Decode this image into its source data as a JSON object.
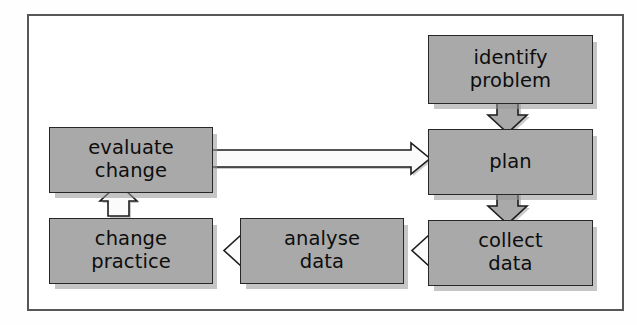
{
  "figure": {
    "kind": "flowchart",
    "frame_border_color": "#575757",
    "box_fill_color": "#a9a9a9",
    "box_border_color": "#272727",
    "text_color": "#0d0d0d",
    "background_color": "#ffffff"
  },
  "nodes": [
    {
      "id": "identify-problem",
      "label": "identify\nproblem",
      "line1": "identify",
      "line2": "problem"
    },
    {
      "id": "plan",
      "label": "plan",
      "line1": "plan",
      "line2": ""
    },
    {
      "id": "collect-data",
      "label": "collect\ndata",
      "line1": "collect",
      "line2": "data"
    },
    {
      "id": "analyse-data",
      "label": "analyse\ndata",
      "line1": "analyse",
      "line2": "data"
    },
    {
      "id": "change-practice",
      "label": "change\npractice",
      "line1": "change",
      "line2": "practice"
    },
    {
      "id": "evaluate-change",
      "label": "evaluate\nchange",
      "line1": "evaluate",
      "line2": "change"
    }
  ],
  "edges": [
    {
      "id": "identify-problem-to-plan",
      "from": "identify-problem",
      "to": "plan",
      "direction": "down",
      "style": "filled-block-arrow"
    },
    {
      "id": "plan-to-collect-data",
      "from": "plan",
      "to": "collect-data",
      "direction": "down",
      "style": "filled-block-arrow"
    },
    {
      "id": "collect-data-to-analyse-data",
      "from": "collect-data",
      "to": "analyse-data",
      "direction": "left",
      "style": "hollow-block-arrow"
    },
    {
      "id": "analyse-data-to-change-practice",
      "from": "analyse-data",
      "to": "change-practice",
      "direction": "left",
      "style": "hollow-block-arrow"
    },
    {
      "id": "change-practice-to-evaluate-change",
      "from": "change-practice",
      "to": "evaluate-change",
      "direction": "up",
      "style": "hollow-block-arrow"
    },
    {
      "id": "evaluate-change-to-plan",
      "from": "evaluate-change",
      "to": "plan",
      "direction": "right",
      "style": "hollow-line-arrow"
    }
  ]
}
